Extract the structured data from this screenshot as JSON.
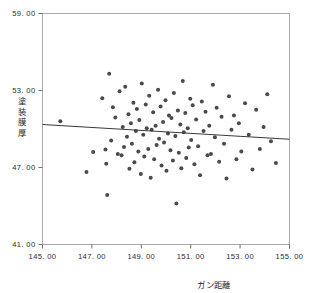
{
  "chart_data": {
    "type": "scatter",
    "title": "",
    "subtitle": "",
    "xlabel": "ガン距離",
    "ylabel": "塗装膜厚",
    "ylabel_chars": [
      "塗",
      "装",
      "膜",
      "厚"
    ],
    "xlim": [
      145.0,
      155.0
    ],
    "ylim": [
      41.0,
      59.0
    ],
    "xticks": [
      145.0,
      147.0,
      149.0,
      151.0,
      153.0,
      155.0
    ],
    "yticks": [
      41.0,
      47.0,
      53.0,
      59.0
    ],
    "xtick_labels": [
      "145. 00",
      "147. 00",
      "149. 00",
      "151. 00",
      "153. 00",
      "155. 00"
    ],
    "ytick_labels": [
      "41. 00",
      "47. 00",
      "53. 00",
      "59. 00"
    ],
    "grid": false,
    "legend": false,
    "legend_position": "none",
    "marker": "filled-circle",
    "marker_color": "#4a4a4a",
    "marker_size": 2.0,
    "frame_color": "#a8a8a8",
    "background_color": "#ffffff",
    "fitline": {
      "name": "linear-fit",
      "color": "#3a3a3a",
      "x_start": 145.0,
      "y_start": 50.35,
      "x_end": 155.0,
      "y_end": 49.2
    },
    "series": [
      {
        "name": "observations",
        "n": 103,
        "x": [
          145.72,
          146.78,
          147.05,
          147.42,
          147.55,
          147.58,
          147.62,
          147.7,
          147.78,
          147.85,
          147.95,
          148.05,
          148.12,
          148.2,
          148.25,
          148.3,
          148.35,
          148.42,
          148.48,
          148.52,
          148.58,
          148.62,
          148.68,
          148.72,
          148.78,
          148.82,
          148.88,
          148.92,
          148.98,
          149.02,
          149.08,
          149.12,
          149.18,
          149.22,
          149.28,
          149.32,
          149.38,
          149.42,
          149.48,
          149.52,
          149.58,
          149.62,
          149.68,
          149.72,
          149.78,
          149.82,
          149.88,
          149.92,
          149.98,
          150.02,
          150.08,
          150.12,
          150.18,
          150.22,
          150.28,
          150.32,
          150.38,
          150.42,
          150.48,
          150.52,
          150.58,
          150.62,
          150.68,
          150.72,
          150.78,
          150.82,
          150.88,
          150.92,
          150.98,
          151.02,
          151.08,
          151.15,
          151.22,
          151.3,
          151.38,
          151.45,
          151.52,
          151.6,
          151.68,
          151.75,
          151.82,
          151.9,
          151.98,
          152.05,
          152.15,
          152.25,
          152.35,
          152.45,
          152.55,
          152.65,
          152.75,
          152.85,
          152.95,
          153.05,
          153.2,
          153.35,
          153.5,
          153.65,
          153.8,
          153.95,
          154.1,
          154.25,
          154.45
        ],
        "y": [
          50.6,
          46.65,
          48.2,
          52.4,
          48.4,
          47.3,
          44.85,
          54.3,
          49.1,
          51.7,
          50.9,
          48.05,
          52.95,
          47.95,
          50.15,
          48.6,
          53.3,
          49.4,
          51.15,
          46.9,
          50.45,
          48.85,
          52.05,
          47.4,
          49.85,
          51.55,
          48.25,
          50.7,
          46.5,
          53.55,
          49.55,
          47.85,
          51.9,
          50.05,
          48.45,
          52.6,
          46.2,
          49.95,
          51.3,
          47.65,
          50.25,
          48.75,
          53.05,
          49.25,
          51.75,
          47.15,
          50.55,
          48.95,
          52.25,
          46.75,
          49.65,
          51.05,
          48.35,
          50.85,
          47.55,
          52.8,
          49.45,
          44.2,
          51.45,
          48.15,
          50.35,
          46.95,
          53.75,
          49.75,
          51.25,
          47.75,
          50.05,
          48.55,
          52.35,
          49.15,
          51.85,
          47.25,
          50.75,
          48.65,
          46.4,
          52.15,
          49.85,
          51.35,
          47.95,
          50.25,
          48.05,
          53.45,
          49.35,
          51.65,
          47.45,
          50.95,
          48.85,
          46.15,
          52.55,
          49.95,
          51.05,
          47.65,
          50.45,
          48.25,
          52.0,
          49.55,
          46.85,
          51.5,
          48.45,
          50.15,
          52.7,
          49.05,
          47.35
        ]
      }
    ]
  }
}
